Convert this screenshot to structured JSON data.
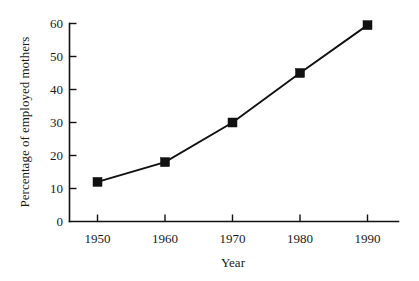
{
  "chart_data": {
    "type": "line",
    "title": "",
    "subtitle": "",
    "xlabel": "Year",
    "ylabel": "Percentage of employed mothers",
    "x": [
      1950,
      1960,
      1970,
      1980,
      1990
    ],
    "categories": [
      "1950",
      "1960",
      "1970",
      "1980",
      "1990"
    ],
    "values": [
      12,
      18,
      30,
      45,
      59.5
    ],
    "series": [
      {
        "name": "Percentage of employed mothers",
        "values": [
          12,
          18,
          30,
          45,
          59.5
        ]
      }
    ],
    "xlim": [
      1945,
      1993
    ],
    "ylim": [
      0,
      60
    ],
    "xticks": [
      1950,
      1960,
      1970,
      1980,
      1990
    ],
    "yticks": [
      0,
      10,
      20,
      30,
      40,
      50,
      60
    ],
    "xtick_labels": [
      "1950",
      "1960",
      "1970",
      "1980",
      "1990"
    ],
    "ytick_labels": [
      "0",
      "10",
      "20",
      "30",
      "40",
      "50",
      "60"
    ],
    "grid": false,
    "legend": false,
    "legend_position": "none",
    "marker": "square",
    "line_color": "#111111",
    "marker_color": "#111111",
    "background_color": "#ffffff",
    "annotations": []
  },
  "axis": {
    "y_title": "Percentage of employed mothers",
    "x_title": "Year",
    "y_ticks": {
      "t0": "0",
      "t1": "10",
      "t2": "20",
      "t3": "30",
      "t4": "40",
      "t5": "50",
      "t6": "60"
    },
    "x_ticks": {
      "t0": "1950",
      "t1": "1960",
      "t2": "1970",
      "t3": "1980",
      "t4": "1990"
    }
  }
}
